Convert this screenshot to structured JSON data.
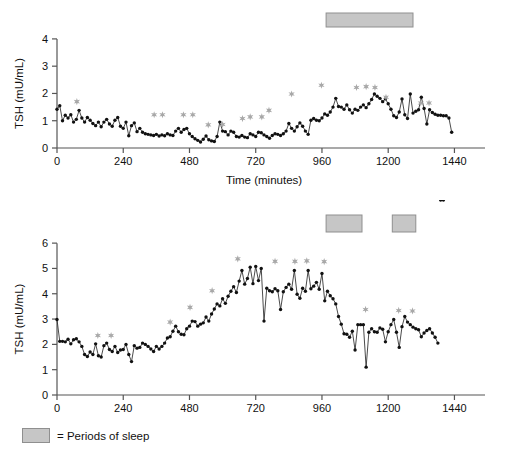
{
  "legend": {
    "swatch_name": "sleep-period-swatch",
    "text": "= Periods of sleep",
    "swatch_color": "#c6c6c6"
  },
  "colors": {
    "line": "#2b2b2b",
    "marker": "#111111",
    "star": "#a8a8a8",
    "sleep_bar_fill": "#c6c6c6",
    "sleep_bar_stroke": "#8f8f8f",
    "axis": "#555555",
    "background": "#ffffff"
  },
  "chart_data": [
    {
      "id": "tsh-subject-1",
      "type": "line",
      "title": "",
      "xlabel": "Time (minutes)",
      "ylabel": "TSH (mU/mL)",
      "xlim": [
        0,
        1500
      ],
      "ylim": [
        0,
        4.4
      ],
      "xticks": [
        0,
        240,
        480,
        720,
        960,
        1200,
        1440
      ],
      "yticks": [
        0,
        1,
        2,
        3,
        4
      ],
      "xtick_labels": [
        "0",
        "240",
        "480",
        "720",
        "960",
        "1200",
        "1440"
      ],
      "ytick_labels": [
        "0",
        "1",
        "2",
        "3",
        "4"
      ],
      "grid": false,
      "markers": "filled-circle",
      "sleep_periods": [
        [
          975,
          1290
        ]
      ],
      "x": [
        0,
        10,
        20,
        30,
        40,
        50,
        60,
        70,
        80,
        90,
        100,
        110,
        120,
        130,
        140,
        150,
        160,
        170,
        180,
        190,
        200,
        210,
        220,
        230,
        240,
        250,
        260,
        270,
        280,
        290,
        300,
        310,
        320,
        330,
        340,
        350,
        360,
        370,
        380,
        390,
        400,
        410,
        420,
        430,
        440,
        450,
        460,
        470,
        480,
        490,
        500,
        510,
        520,
        530,
        540,
        550,
        560,
        570,
        580,
        590,
        600,
        610,
        620,
        630,
        640,
        650,
        660,
        670,
        680,
        690,
        700,
        710,
        720,
        730,
        740,
        750,
        760,
        770,
        780,
        790,
        800,
        810,
        820,
        830,
        840,
        850,
        860,
        870,
        880,
        890,
        900,
        910,
        920,
        930,
        940,
        950,
        960,
        970,
        980,
        990,
        1000,
        1010,
        1020,
        1030,
        1040,
        1050,
        1060,
        1070,
        1080,
        1090,
        1100,
        1110,
        1120,
        1130,
        1140,
        1150,
        1160,
        1170,
        1180,
        1190,
        1200,
        1210,
        1220,
        1230,
        1240,
        1250,
        1260,
        1270,
        1280,
        1290,
        1300,
        1310,
        1320,
        1330,
        1340,
        1350,
        1360,
        1370,
        1380,
        1390,
        1400,
        1410,
        1420,
        1430
      ],
      "y": [
        1.42,
        1.55,
        1.0,
        1.2,
        1.1,
        1.22,
        0.95,
        1.05,
        1.38,
        1.1,
        0.95,
        1.12,
        1.02,
        0.9,
        0.82,
        0.95,
        0.78,
        0.95,
        1.05,
        0.88,
        0.8,
        1.02,
        1.12,
        0.8,
        0.72,
        0.95,
        0.45,
        0.82,
        0.92,
        0.6,
        0.72,
        0.58,
        0.52,
        0.5,
        0.48,
        0.46,
        0.5,
        0.44,
        0.48,
        0.45,
        0.52,
        0.48,
        0.46,
        0.62,
        0.72,
        0.58,
        0.68,
        0.72,
        0.52,
        0.42,
        0.34,
        0.28,
        0.22,
        0.32,
        0.44,
        0.3,
        0.26,
        0.24,
        0.42,
        0.95,
        0.62,
        0.6,
        0.48,
        0.62,
        0.58,
        0.42,
        0.4,
        0.46,
        0.4,
        0.38,
        0.52,
        0.48,
        0.42,
        0.58,
        0.56,
        0.48,
        0.42,
        0.36,
        0.46,
        0.52,
        0.5,
        0.46,
        0.52,
        0.62,
        0.9,
        0.72,
        0.62,
        0.78,
        0.92,
        0.8,
        0.62,
        0.5,
        1.02,
        1.08,
        1.02,
        1.0,
        1.1,
        1.25,
        1.2,
        1.32,
        1.5,
        1.82,
        1.52,
        1.5,
        1.42,
        1.58,
        1.4,
        1.28,
        1.42,
        1.38,
        1.5,
        1.58,
        1.48,
        1.62,
        1.78,
        1.98,
        1.9,
        1.82,
        1.7,
        1.8,
        1.62,
        1.42,
        1.18,
        1.12,
        1.32,
        1.8,
        1.22,
        1.08,
        1.98,
        1.28,
        1.35,
        1.4,
        1.86,
        1.45,
        0.88,
        1.4,
        1.3,
        1.24,
        1.2,
        1.2,
        1.18,
        1.18,
        1.1,
        0.58,
        1.05,
        1.28,
        1.18,
        1.3,
        0.92,
        0.72,
        0.48,
        0.52,
        0.58,
        0.52
      ],
      "stars": [
        {
          "x": 72,
          "y": 1.7
        },
        {
          "x": 352,
          "y": 1.22
        },
        {
          "x": 382,
          "y": 1.22
        },
        {
          "x": 458,
          "y": 1.22
        },
        {
          "x": 492,
          "y": 1.22
        },
        {
          "x": 548,
          "y": 0.85
        },
        {
          "x": 600,
          "y": 0.86
        },
        {
          "x": 672,
          "y": 1.08
        },
        {
          "x": 700,
          "y": 1.14
        },
        {
          "x": 742,
          "y": 1.14
        },
        {
          "x": 768,
          "y": 1.38
        },
        {
          "x": 850,
          "y": 1.98
        },
        {
          "x": 958,
          "y": 2.3
        },
        {
          "x": 1085,
          "y": 2.22
        },
        {
          "x": 1120,
          "y": 2.25
        },
        {
          "x": 1152,
          "y": 2.22
        },
        {
          "x": 1192,
          "y": 1.86
        },
        {
          "x": 1318,
          "y": 1.65
        },
        {
          "x": 1348,
          "y": 1.65
        }
      ]
    },
    {
      "id": "tsh-subject-2",
      "type": "line",
      "title": "",
      "xlabel": "Time (minutes)",
      "ylabel": "TSH (mU/mL)",
      "xlim": [
        0,
        1500
      ],
      "ylim": [
        0,
        6.4
      ],
      "xticks": [
        0,
        240,
        480,
        720,
        960,
        1200,
        1440
      ],
      "yticks": [
        0,
        1,
        2,
        3,
        4,
        5,
        6
      ],
      "xtick_labels": [
        "0",
        "240",
        "480",
        "720",
        "960",
        "1200",
        "1440"
      ],
      "ytick_labels": [
        "0",
        "1",
        "2",
        "3",
        "4",
        "5",
        "6"
      ],
      "grid": false,
      "markers": "filled-circle",
      "sleep_periods": [
        [
          975,
          1105
        ],
        [
          1215,
          1300
        ]
      ],
      "x": [
        0,
        10,
        20,
        30,
        40,
        50,
        60,
        70,
        80,
        90,
        100,
        110,
        120,
        130,
        140,
        150,
        160,
        170,
        180,
        190,
        200,
        210,
        220,
        230,
        240,
        250,
        260,
        270,
        280,
        290,
        300,
        310,
        320,
        330,
        340,
        350,
        360,
        370,
        380,
        390,
        400,
        410,
        420,
        430,
        440,
        450,
        460,
        470,
        480,
        490,
        500,
        510,
        520,
        530,
        540,
        550,
        560,
        570,
        580,
        590,
        600,
        610,
        620,
        630,
        640,
        650,
        660,
        670,
        680,
        690,
        700,
        710,
        720,
        730,
        740,
        750,
        760,
        770,
        780,
        790,
        800,
        810,
        820,
        830,
        840,
        850,
        860,
        870,
        880,
        890,
        900,
        910,
        920,
        930,
        940,
        950,
        960,
        970,
        980,
        990,
        1000,
        1010,
        1020,
        1030,
        1040,
        1050,
        1060,
        1070,
        1080,
        1090,
        1100,
        1110,
        1120,
        1130,
        1140,
        1150,
        1160,
        1170,
        1180,
        1190,
        1200,
        1210,
        1220,
        1230,
        1240,
        1250,
        1260,
        1270,
        1280,
        1290,
        1300,
        1310,
        1320,
        1330,
        1340,
        1350,
        1360,
        1370,
        1380,
        1390,
        1400
      ],
      "y": [
        2.98,
        2.12,
        2.12,
        2.1,
        2.2,
        2.02,
        2.18,
        2.22,
        2.1,
        1.92,
        1.6,
        1.52,
        1.7,
        1.6,
        2.02,
        1.55,
        1.5,
        1.95,
        2.05,
        1.8,
        1.72,
        1.92,
        1.68,
        1.78,
        1.8,
        2.0,
        1.6,
        1.32,
        1.95,
        1.85,
        1.88,
        2.05,
        2.0,
        1.92,
        1.82,
        1.72,
        1.92,
        1.82,
        1.92,
        2.05,
        2.25,
        2.3,
        2.52,
        2.72,
        2.5,
        2.4,
        2.38,
        2.62,
        2.72,
        2.92,
        2.9,
        2.72,
        2.8,
        2.85,
        3.08,
        2.92,
        3.2,
        3.4,
        3.6,
        3.52,
        3.8,
        3.62,
        3.9,
        4.1,
        4.28,
        4.05,
        4.5,
        4.92,
        4.38,
        4.6,
        5.05,
        4.4,
        5.08,
        4.52,
        5.0,
        2.92,
        4.22,
        4.12,
        4.08,
        4.2,
        4.12,
        3.38,
        4.08,
        4.25,
        4.38,
        4.18,
        4.92,
        3.98,
        3.82,
        4.22,
        4.1,
        4.92,
        4.2,
        4.3,
        4.45,
        4.18,
        4.8,
        3.72,
        4.1,
        3.92,
        3.8,
        3.6,
        3.1,
        2.8,
        2.42,
        2.4,
        2.28,
        2.52,
        1.78,
        2.78,
        2.78,
        2.78,
        1.1,
        2.48,
        2.62,
        2.5,
        2.48,
        2.65,
        2.6,
        2.1,
        2.5,
        2.78,
        2.98,
        2.48,
        1.88,
        2.7,
        3.1,
        2.88,
        2.78,
        2.68,
        2.62,
        2.58,
        2.3,
        2.45,
        2.55,
        2.62,
        2.45,
        2.28,
        2.05
      ],
      "stars": [
        {
          "x": 148,
          "y": 2.35
        },
        {
          "x": 196,
          "y": 2.35
        },
        {
          "x": 410,
          "y": 2.88
        },
        {
          "x": 482,
          "y": 3.46
        },
        {
          "x": 562,
          "y": 4.12
        },
        {
          "x": 655,
          "y": 5.38
        },
        {
          "x": 790,
          "y": 5.28
        },
        {
          "x": 862,
          "y": 5.28
        },
        {
          "x": 905,
          "y": 5.3
        },
        {
          "x": 968,
          "y": 5.27
        },
        {
          "x": 1118,
          "y": 3.38
        },
        {
          "x": 1238,
          "y": 3.34
        },
        {
          "x": 1288,
          "y": 3.32
        }
      ]
    }
  ]
}
